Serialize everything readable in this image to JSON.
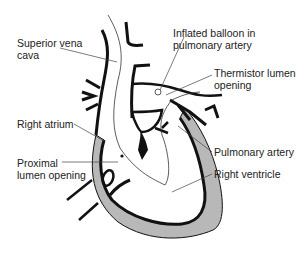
{
  "diagram": {
    "colors": {
      "outline": "#111111",
      "myocardium_fill": "#b8b8b8",
      "catheter": "#333333",
      "text": "#222222",
      "leader": "#444444"
    },
    "labels": {
      "superior_vena_cava": [
        "Superior vena",
        "cava"
      ],
      "inflated_balloon": [
        "Inflated balloon in",
        "pulmonary artery"
      ],
      "thermistor_lumen": [
        "Thermistor lumen",
        "opening"
      ],
      "right_atrium": [
        "Right atrium"
      ],
      "proximal_lumen": [
        "Proximal",
        "lumen opening"
      ],
      "pulmonary_artery": [
        "Pulmonary artery"
      ],
      "right_ventricle": [
        "Right ventricle"
      ]
    }
  }
}
